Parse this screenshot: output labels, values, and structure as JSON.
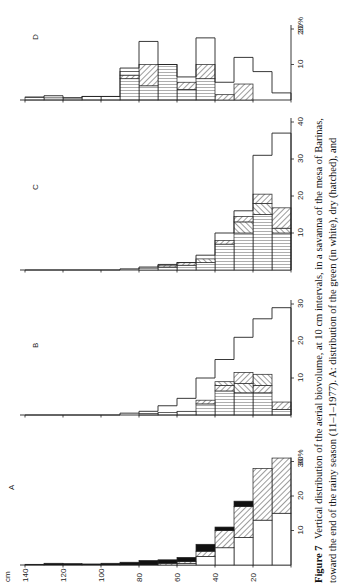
{
  "chart_data": {
    "type": "bar",
    "orientation": "horizontal-histogram (page rotated 90°)",
    "title": "Figure 7",
    "caption": {
      "label": "Figure 7",
      "line1": "Vertical distribution of the aerial biovolume, at 10 cm intervals, in a savanna of the mesa of Barinas,",
      "line2": "toward the end of the rainy season (11–1–1977). A: distribution of the green (in white), dry (hatched), and"
    },
    "ylabel": "cm",
    "xlabel": "%",
    "height_ticks": [
      140,
      120,
      100,
      80,
      60,
      40,
      20
    ],
    "height_classes_cm": [
      "0-10",
      "10-20",
      "20-30",
      "30-40",
      "40-50",
      "50-60",
      "60-70",
      "70-80",
      "80-90",
      "90-100",
      "100-110",
      "110-120",
      "120-130",
      "130-140"
    ],
    "legend": [
      {
        "name": "green",
        "pattern": "white"
      },
      {
        "name": "dry",
        "pattern": "hatched"
      },
      {
        "name": "dead/other",
        "pattern": "black"
      },
      {
        "name": "vertical-striped component",
        "pattern": "vertical-lines"
      }
    ],
    "panels": [
      {
        "id": "A",
        "label": "A",
        "pct_ticks": [
          10,
          20,
          30
        ],
        "pct_max_label": "30 %",
        "xlim": [
          0,
          30
        ],
        "classes": [
          {
            "cm": "0-10",
            "segments": [
              {
                "type": "white",
                "value": 15
              },
              {
                "type": "hatch",
                "value": 16
              }
            ]
          },
          {
            "cm": "10-20",
            "segments": [
              {
                "type": "white",
                "value": 13
              },
              {
                "type": "hatch",
                "value": 15
              }
            ]
          },
          {
            "cm": "20-30",
            "segments": [
              {
                "type": "white",
                "value": 8
              },
              {
                "type": "hatch",
                "value": 9
              },
              {
                "type": "black",
                "value": 1.5
              }
            ]
          },
          {
            "cm": "30-40",
            "segments": [
              {
                "type": "white",
                "value": 5
              },
              {
                "type": "hatch",
                "value": 5
              },
              {
                "type": "black",
                "value": 1
              }
            ]
          },
          {
            "cm": "40-50",
            "segments": [
              {
                "type": "white",
                "value": 2.5
              },
              {
                "type": "hatch",
                "value": 1.5
              },
              {
                "type": "black",
                "value": 2
              }
            ]
          },
          {
            "cm": "50-60",
            "segments": [
              {
                "type": "white",
                "value": 0.5
              },
              {
                "type": "hatch",
                "value": 0.5
              },
              {
                "type": "black",
                "value": 1.2
              }
            ]
          },
          {
            "cm": "60-70",
            "segments": [
              {
                "type": "hatch",
                "value": 0.5
              },
              {
                "type": "black",
                "value": 1
              }
            ]
          },
          {
            "cm": "70-80",
            "segments": [
              {
                "type": "black",
                "value": 1.3
              }
            ]
          },
          {
            "cm": "80-90",
            "segments": [
              {
                "type": "black",
                "value": 0.8
              }
            ]
          },
          {
            "cm": "90-100",
            "segments": [
              {
                "type": "black",
                "value": 0.5
              }
            ]
          },
          {
            "cm": "100-110",
            "segments": [
              {
                "type": "black",
                "value": 0.3
              }
            ]
          },
          {
            "cm": "110-120",
            "segments": [
              {
                "type": "black",
                "value": 0.4
              }
            ]
          },
          {
            "cm": "120-130",
            "segments": [
              {
                "type": "black",
                "value": 0.5
              }
            ]
          },
          {
            "cm": "130-140",
            "segments": [
              {
                "type": "black",
                "value": 0.2
              }
            ]
          }
        ]
      },
      {
        "id": "B",
        "label": "B",
        "pct_ticks": [
          10,
          20,
          30
        ],
        "xlim": [
          0,
          30
        ],
        "outline": [
          29,
          26,
          21,
          15,
          10,
          4.5,
          2.5,
          1,
          0.5,
          0,
          0,
          0,
          0,
          0
        ],
        "classes": [
          {
            "cm": "0-10",
            "segments": [
              {
                "type": "vlines",
                "value": 1.5
              },
              {
                "type": "hatch",
                "value": 2
              }
            ]
          },
          {
            "cm": "10-20",
            "segments": [
              {
                "type": "vlines",
                "value": 6
              },
              {
                "type": "hatch",
                "value": 2
              },
              {
                "type": "hatch2",
                "value": 3
              }
            ]
          },
          {
            "cm": "20-30",
            "segments": [
              {
                "type": "vlines",
                "value": 6
              },
              {
                "type": "hatch2",
                "value": 2.5
              },
              {
                "type": "hatch",
                "value": 3
              }
            ]
          },
          {
            "cm": "30-40",
            "segments": [
              {
                "type": "vlines",
                "value": 6.5
              },
              {
                "type": "hatch",
                "value": 1.5
              },
              {
                "type": "hatch2",
                "value": 1
              }
            ]
          },
          {
            "cm": "40-50",
            "segments": [
              {
                "type": "vlines",
                "value": 3
              },
              {
                "type": "hatch",
                "value": 1
              }
            ]
          },
          {
            "cm": "50-60",
            "segments": [
              {
                "type": "vlines",
                "value": 1
              }
            ]
          },
          {
            "cm": "60-70",
            "segments": [
              {
                "type": "vlines",
                "value": 0.7
              }
            ]
          },
          {
            "cm": "70-80",
            "segments": [
              {
                "type": "vlines",
                "value": 0.4
              }
            ]
          }
        ]
      },
      {
        "id": "C",
        "label": "C",
        "pct_ticks": [
          10,
          20,
          30,
          40
        ],
        "xlim": [
          0,
          40
        ],
        "outline": [
          37,
          31,
          16,
          10,
          4,
          2,
          1.5,
          0.8,
          0.3,
          0,
          0,
          0,
          0,
          0
        ],
        "classes": [
          {
            "cm": "0-10",
            "segments": [
              {
                "type": "vlines",
                "value": 10
              },
              {
                "type": "hatch2",
                "value": 1.3
              },
              {
                "type": "hatch",
                "value": 5.5
              }
            ]
          },
          {
            "cm": "10-20",
            "segments": [
              {
                "type": "vlines",
                "value": 15
              },
              {
                "type": "hatch2",
                "value": 3
              },
              {
                "type": "hatch",
                "value": 2.5
              }
            ]
          },
          {
            "cm": "20-30",
            "segments": [
              {
                "type": "vlines",
                "value": 10
              },
              {
                "type": "hatch2",
                "value": 3
              },
              {
                "type": "hatch",
                "value": 1.5
              }
            ]
          },
          {
            "cm": "30-40",
            "segments": [
              {
                "type": "vlines",
                "value": 7
              },
              {
                "type": "hatch",
                "value": 1
              }
            ]
          },
          {
            "cm": "40-50",
            "segments": [
              {
                "type": "vlines",
                "value": 2
              },
              {
                "type": "hatch2",
                "value": 1
              }
            ]
          },
          {
            "cm": "50-60",
            "segments": [
              {
                "type": "vlines",
                "value": 1.3
              },
              {
                "type": "hatch",
                "value": 0.7
              }
            ]
          },
          {
            "cm": "60-70",
            "segments": [
              {
                "type": "vlines",
                "value": 0.8
              },
              {
                "type": "hatch",
                "value": 0.5
              }
            ]
          },
          {
            "cm": "70-80",
            "segments": [
              {
                "type": "vlines",
                "value": 0.5
              }
            ]
          }
        ]
      },
      {
        "id": "D",
        "label": "D",
        "pct_ticks": [
          10,
          20
        ],
        "pct_max_label": "20 %",
        "xlim": [
          0,
          20
        ],
        "outline": [
          2,
          8,
          12,
          5,
          17.5,
          6.5,
          10,
          16.5,
          9,
          1,
          1,
          0.6,
          1.2,
          0.8
        ],
        "classes": [
          {
            "cm": "0-10",
            "segments": []
          },
          {
            "cm": "10-20",
            "segments": []
          },
          {
            "cm": "20-30",
            "segments": [
              {
                "type": "hatch",
                "value": 4.5
              }
            ]
          },
          {
            "cm": "30-40",
            "segments": [
              {
                "type": "hatch",
                "value": 1.5
              }
            ]
          },
          {
            "cm": "40-50",
            "segments": [
              {
                "type": "vlines",
                "value": 6
              },
              {
                "type": "hatch",
                "value": 4
              }
            ]
          },
          {
            "cm": "50-60",
            "segments": [
              {
                "type": "vlines",
                "value": 3
              },
              {
                "type": "hatch",
                "value": 2
              }
            ]
          },
          {
            "cm": "60-70",
            "segments": [
              {
                "type": "vlines",
                "value": 10
              }
            ]
          },
          {
            "cm": "70-80",
            "segments": [
              {
                "type": "vlines",
                "value": 4
              },
              {
                "type": "hatch",
                "value": 6
              }
            ]
          },
          {
            "cm": "80-90",
            "segments": [
              {
                "type": "vlines",
                "value": 6
              },
              {
                "type": "hatch",
                "value": 1
              },
              {
                "type": "white",
                "value": 1
              }
            ]
          },
          {
            "cm": "90-100",
            "segments": [
              {
                "type": "vlines",
                "value": 1
              }
            ]
          },
          {
            "cm": "100-110",
            "segments": [
              {
                "type": "vlines",
                "value": 1
              }
            ]
          },
          {
            "cm": "110-120",
            "segments": [
              {
                "type": "vlines",
                "value": 0.6
              }
            ]
          },
          {
            "cm": "120-130",
            "segments": [
              {
                "type": "vlines",
                "value": 0.6
              }
            ]
          },
          {
            "cm": "130-140",
            "segments": [
              {
                "type": "vlines",
                "value": 0.8
              }
            ]
          }
        ]
      }
    ]
  },
  "axis": {
    "unit_label": "cm",
    "ticks": [
      "140",
      "120",
      "100",
      "80",
      "60",
      "40",
      "20"
    ]
  }
}
